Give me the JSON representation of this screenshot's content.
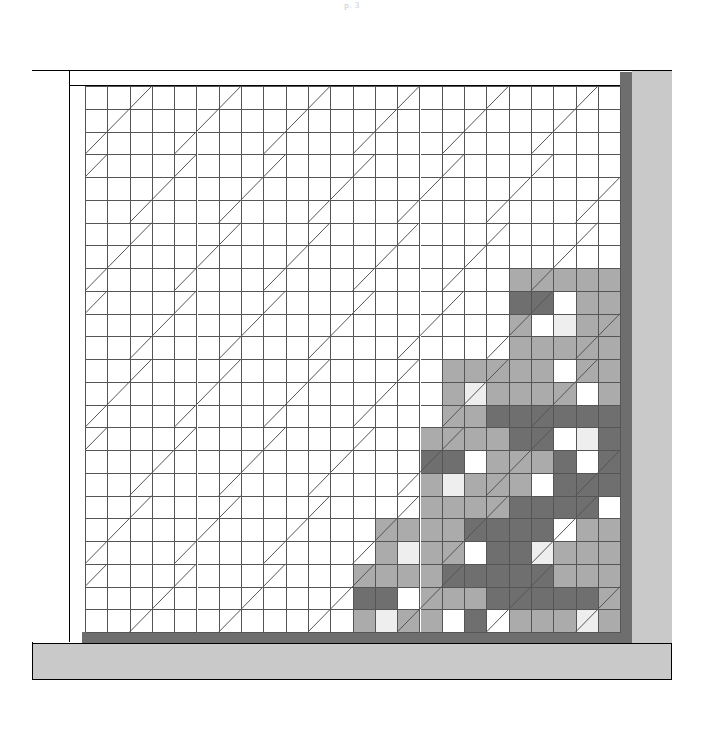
{
  "page": {
    "marker": "p. 3"
  },
  "figure": {
    "name": "grid-elevation",
    "frame_label": "outer frame",
    "header_band_label": "header band",
    "left_wall_label": "left wall",
    "right_column_label": "right column",
    "plinth_label": "base plinth",
    "beam_right_label": "right beam",
    "beam_bottom_label": "bottom beam"
  },
  "colors": {
    "page_background": "#ffffff",
    "line": "#555555",
    "frame_line": "#000000",
    "beam_dark": "#6e6e6e",
    "plinth_gray": "#c9c9c9",
    "tone_empty": "#ffffff",
    "tone_light": "#d8d8d8",
    "tone_mid": "#ababab",
    "tone_dark": "#6f6f6f",
    "tone_pale": "#eeeeee"
  },
  "grid": {
    "columns": 24,
    "rows": 24,
    "cell_width": 22.3,
    "cell_height": 22.75,
    "origin_x": 85,
    "origin_y": 86,
    "diagonal_period_x": 4,
    "diagonal_period_y": 3,
    "diagonal_span_cols": 3,
    "diagonal_span_rows": 3,
    "legend": {
      "0": "empty",
      "1": "light",
      "2": "mid",
      "3": "dark",
      "4": "pale"
    },
    "cells": [
      [
        0,
        0,
        0,
        0,
        0,
        0,
        0,
        0,
        0,
        0,
        0,
        0,
        0,
        0,
        0,
        0,
        0,
        0,
        0,
        0,
        0,
        0,
        0,
        0
      ],
      [
        0,
        0,
        0,
        0,
        0,
        0,
        0,
        0,
        0,
        0,
        0,
        0,
        0,
        0,
        0,
        0,
        0,
        0,
        0,
        0,
        0,
        0,
        0,
        0
      ],
      [
        0,
        0,
        0,
        0,
        0,
        0,
        0,
        0,
        0,
        0,
        0,
        0,
        0,
        0,
        0,
        0,
        0,
        0,
        0,
        0,
        0,
        0,
        0,
        0
      ],
      [
        0,
        0,
        0,
        0,
        0,
        0,
        0,
        0,
        0,
        0,
        0,
        0,
        0,
        0,
        0,
        0,
        0,
        0,
        0,
        0,
        0,
        0,
        0,
        0
      ],
      [
        0,
        0,
        0,
        0,
        0,
        0,
        0,
        0,
        0,
        0,
        0,
        0,
        0,
        0,
        0,
        0,
        0,
        0,
        0,
        0,
        0,
        0,
        0,
        0
      ],
      [
        0,
        0,
        0,
        0,
        0,
        0,
        0,
        0,
        0,
        0,
        0,
        0,
        0,
        0,
        0,
        0,
        0,
        0,
        0,
        0,
        0,
        0,
        0,
        0
      ],
      [
        0,
        0,
        0,
        0,
        0,
        0,
        0,
        0,
        0,
        0,
        0,
        0,
        0,
        0,
        0,
        0,
        0,
        0,
        0,
        0,
        0,
        0,
        0,
        0
      ],
      [
        0,
        0,
        0,
        0,
        0,
        0,
        0,
        0,
        0,
        0,
        0,
        0,
        0,
        0,
        0,
        0,
        0,
        0,
        0,
        0,
        0,
        0,
        0,
        0
      ],
      [
        0,
        0,
        0,
        0,
        0,
        0,
        0,
        0,
        0,
        0,
        0,
        0,
        0,
        0,
        0,
        0,
        0,
        0,
        0,
        2,
        2,
        2,
        2,
        2
      ],
      [
        0,
        0,
        0,
        0,
        0,
        0,
        0,
        0,
        0,
        0,
        0,
        0,
        0,
        0,
        0,
        0,
        0,
        0,
        0,
        3,
        3,
        0,
        2,
        2
      ],
      [
        0,
        0,
        0,
        0,
        0,
        0,
        0,
        0,
        0,
        0,
        0,
        0,
        0,
        0,
        0,
        0,
        0,
        0,
        0,
        2,
        0,
        4,
        2,
        2
      ],
      [
        0,
        0,
        0,
        0,
        0,
        0,
        0,
        0,
        0,
        0,
        0,
        0,
        0,
        0,
        0,
        0,
        0,
        0,
        0,
        2,
        2,
        2,
        2,
        2
      ],
      [
        0,
        0,
        0,
        0,
        0,
        0,
        0,
        0,
        0,
        0,
        0,
        0,
        0,
        0,
        0,
        0,
        2,
        2,
        2,
        2,
        2,
        0,
        2,
        2
      ],
      [
        0,
        0,
        0,
        0,
        0,
        0,
        0,
        0,
        0,
        0,
        0,
        0,
        0,
        0,
        0,
        0,
        2,
        4,
        2,
        2,
        2,
        2,
        0,
        2
      ],
      [
        0,
        0,
        0,
        0,
        0,
        0,
        0,
        0,
        0,
        0,
        0,
        0,
        0,
        0,
        0,
        0,
        2,
        2,
        3,
        3,
        3,
        3,
        3,
        3
      ],
      [
        0,
        0,
        0,
        0,
        0,
        0,
        0,
        0,
        0,
        0,
        0,
        0,
        0,
        0,
        0,
        2,
        2,
        2,
        2,
        3,
        3,
        0,
        4,
        3
      ],
      [
        0,
        0,
        0,
        0,
        0,
        0,
        0,
        0,
        0,
        0,
        0,
        0,
        0,
        0,
        0,
        3,
        3,
        0,
        2,
        2,
        2,
        3,
        0,
        3
      ],
      [
        0,
        0,
        0,
        0,
        0,
        0,
        0,
        0,
        0,
        0,
        0,
        0,
        0,
        0,
        0,
        2,
        4,
        2,
        2,
        2,
        0,
        3,
        3,
        3
      ],
      [
        0,
        0,
        0,
        0,
        0,
        0,
        0,
        0,
        0,
        0,
        0,
        0,
        0,
        0,
        0,
        2,
        2,
        2,
        2,
        3,
        3,
        3,
        3,
        0
      ],
      [
        0,
        0,
        0,
        0,
        0,
        0,
        0,
        0,
        0,
        0,
        0,
        0,
        0,
        2,
        2,
        2,
        2,
        3,
        3,
        3,
        3,
        0,
        2,
        2
      ],
      [
        0,
        0,
        0,
        0,
        0,
        0,
        0,
        0,
        0,
        0,
        0,
        0,
        0,
        2,
        4,
        2,
        2,
        0,
        3,
        3,
        4,
        2,
        2,
        2
      ],
      [
        0,
        0,
        0,
        0,
        0,
        0,
        0,
        0,
        0,
        0,
        0,
        0,
        2,
        2,
        2,
        2,
        3,
        3,
        3,
        3,
        3,
        2,
        2,
        2
      ],
      [
        0,
        0,
        0,
        0,
        0,
        0,
        0,
        0,
        0,
        0,
        0,
        0,
        3,
        3,
        0,
        2,
        2,
        2,
        3,
        3,
        3,
        3,
        3,
        2
      ],
      [
        0,
        0,
        0,
        0,
        0,
        0,
        0,
        0,
        0,
        0,
        0,
        0,
        2,
        4,
        2,
        2,
        0,
        3,
        0,
        2,
        2,
        2,
        4,
        2
      ],
      [
        0,
        0,
        0,
        0,
        0,
        0,
        0,
        0,
        0,
        0,
        0,
        0,
        2,
        2,
        2,
        3,
        0,
        3,
        3,
        2,
        0,
        2,
        2,
        2
      ]
    ]
  }
}
